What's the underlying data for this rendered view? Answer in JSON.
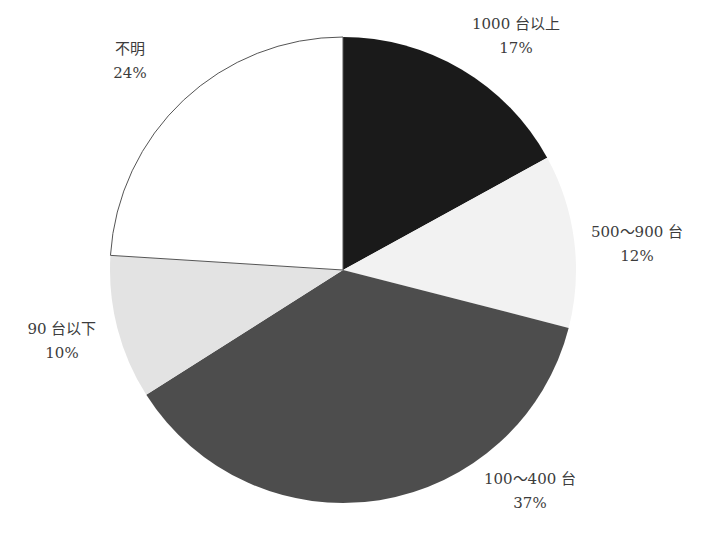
{
  "chart_data": {
    "type": "pie",
    "title": "",
    "start_angle_deg": 0,
    "direction": "clockwise",
    "center": [
      343,
      270
    ],
    "radius": 233,
    "categories": [
      "1000台以上",
      "500～900台",
      "100～400台",
      "90台以下",
      "不明"
    ],
    "values": [
      17,
      12,
      37,
      10,
      24
    ],
    "unit": "%",
    "slices": [
      {
        "name": "1000 台以上",
        "value": 17,
        "percent_label": "17%",
        "color": "#1a1a1a",
        "stroke": "none",
        "label_pos": [
          516,
          12
        ]
      },
      {
        "name": "500～900 台",
        "value": 12,
        "percent_label": "12%",
        "color": "#f2f2f2",
        "stroke": "none",
        "label_pos": [
          637,
          220
        ]
      },
      {
        "name": "100～400 台",
        "value": 37,
        "percent_label": "37%",
        "color": "#4d4d4d",
        "stroke": "none",
        "label_pos": [
          530,
          467
        ]
      },
      {
        "name": "90 台以下",
        "value": 10,
        "percent_label": "10%",
        "color": "#e3e3e3",
        "stroke": "none",
        "label_pos": [
          62,
          317
        ]
      },
      {
        "name": "不明",
        "value": 24,
        "percent_label": "24%",
        "color": "#ffffff",
        "stroke": "#555555",
        "label_pos": [
          130,
          37
        ]
      }
    ],
    "legend": null,
    "labels_outside": true
  }
}
